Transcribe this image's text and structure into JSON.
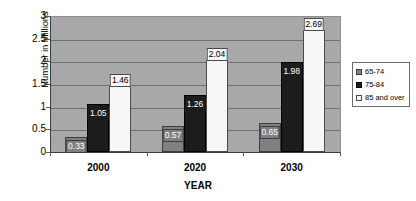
{
  "chart_data": {
    "type": "bar",
    "title": "",
    "subtitle": "",
    "xlabel": "YEAR",
    "ylabel": "Number in Millions",
    "categories": [
      "2000",
      "2020",
      "2030"
    ],
    "series": [
      {
        "name": "65-74",
        "values": [
          0.33,
          0.57,
          0.65
        ],
        "color": "#808080"
      },
      {
        "name": "75-84",
        "values": [
          1.05,
          1.26,
          1.98
        ],
        "color": "#1c1c1c"
      },
      {
        "name": "85 and over",
        "values": [
          1.46,
          2.04,
          2.69
        ],
        "color": "#f7f7f7"
      }
    ],
    "data_labels": [
      [
        "0.33",
        "0.57",
        "0.65"
      ],
      [
        "1.05",
        "1.26",
        "1.98"
      ],
      [
        "1.46",
        "2.04",
        "2.69"
      ]
    ],
    "ylim": [
      0,
      3
    ],
    "yticks": [
      0,
      0.5,
      1,
      1.5,
      2,
      2.5,
      3
    ],
    "ytick_labels": [
      "0",
      "0.5",
      "1",
      "1.5",
      "2",
      "2.5",
      "3"
    ],
    "grid": true,
    "grid_axis": "y",
    "legend_position": "right",
    "legend_entries": [
      "65-74",
      "75-84",
      "85 and over"
    ],
    "plot_background": "#a8a8a8",
    "figure_background": "#ffffff"
  }
}
